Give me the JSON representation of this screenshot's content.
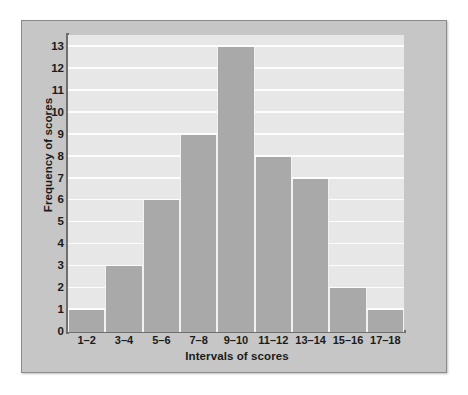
{
  "figure": {
    "panel_background": "#c6c6c6",
    "plot_background": "#e7e7e7",
    "bar_color": "#a9a9a9",
    "gridline_color": "#fdfdfd",
    "axis_color": "#6e6e6e"
  },
  "chart_data": {
    "type": "bar",
    "title": "",
    "xlabel": "Intervals of scores",
    "ylabel": "Frequency of scores",
    "categories": [
      "1–2",
      "3–4",
      "5–6",
      "7–8",
      "9–10",
      "11–12",
      "13–14",
      "15–16",
      "17–18"
    ],
    "values": [
      1,
      3,
      6,
      9,
      13,
      8,
      7,
      2,
      1
    ],
    "ylim": [
      0,
      13
    ],
    "yticks": [
      0,
      1,
      2,
      3,
      4,
      5,
      6,
      7,
      8,
      9,
      10,
      11,
      12,
      13
    ],
    "ytick_labels": [
      "0",
      "1",
      "2",
      "3",
      "4",
      "5",
      "6",
      "7",
      "8",
      "9",
      "10",
      "11",
      "12",
      "13"
    ],
    "grid": true,
    "grid_axis": "y",
    "legend": false,
    "legend_position": "none"
  }
}
